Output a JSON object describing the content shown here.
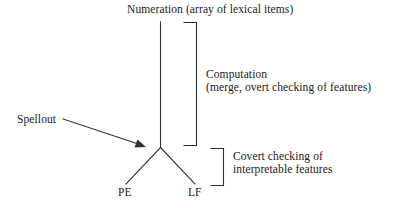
{
  "diagram": {
    "title_top": "Numeration (array of lexical items)",
    "spellout_label": "Spellout",
    "computation": {
      "line1": "Computation",
      "line2": "(merge, overt checking of features)"
    },
    "covert": {
      "line1": "Covert checking of",
      "line2": "interpretable features"
    },
    "branch_left_label": "PE",
    "branch_right_label": "LF",
    "stroke_color": "#303030",
    "background_color": "#ffffff"
  }
}
